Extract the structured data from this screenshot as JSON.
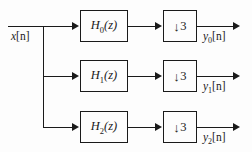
{
  "figure": {
    "type": "block-diagram",
    "background_color": "#fdfdfd",
    "line_color": "#1a1a1a"
  },
  "signals": {
    "input": {
      "name": "x[n]",
      "base": "x",
      "sub": "",
      "brackets": "[n]"
    },
    "outputs": [
      {
        "name": "y0[n]",
        "base": "y",
        "sub": "0",
        "brackets": "[n]"
      },
      {
        "name": "y1[n]",
        "base": "y",
        "sub": "1",
        "brackets": "[n]"
      },
      {
        "name": "y2[n]",
        "base": "y",
        "sub": "2",
        "brackets": "[n]"
      }
    ]
  },
  "branches": [
    {
      "filter": {
        "base": "H",
        "sub": "0",
        "arg": "(z)",
        "name": "H0(z)"
      },
      "decimator": {
        "arrow": "↓",
        "factor": "3",
        "name": "down-3"
      },
      "output": "y0[n]"
    },
    {
      "filter": {
        "base": "H",
        "sub": "1",
        "arg": "(z)",
        "name": "H1(z)"
      },
      "decimator": {
        "arrow": "↓",
        "factor": "3",
        "name": "down-3"
      },
      "output": "y1[n]"
    },
    {
      "filter": {
        "base": "H",
        "sub": "2",
        "arg": "(z)",
        "name": "H2(z)"
      },
      "decimator": {
        "arrow": "↓",
        "factor": "3",
        "name": "down-3"
      },
      "output": "y2[n]"
    }
  ]
}
